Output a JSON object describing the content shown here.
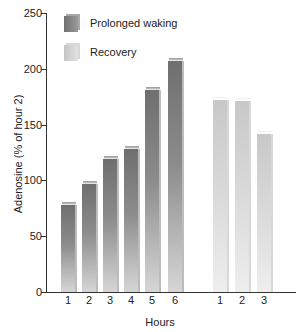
{
  "chart_data": {
    "type": "bar",
    "title": "",
    "xlabel": "Hours",
    "ylabel": "Adenosine (% of hour 2)",
    "ylim": [
      0,
      250
    ],
    "yticks": [
      0,
      50,
      100,
      150,
      200,
      250
    ],
    "grid": false,
    "legend_position": "top-left",
    "series": [
      {
        "name": "Prolonged waking",
        "categories": [
          "1",
          "2",
          "3",
          "4",
          "5",
          "6"
        ],
        "values": [
          78,
          97,
          119,
          128,
          181,
          207
        ],
        "color": "#7a7a7a"
      },
      {
        "name": "Recovery",
        "categories": [
          "1",
          "2",
          "3"
        ],
        "values": [
          172,
          171,
          142
        ],
        "color": "#d4d4d4"
      }
    ]
  },
  "labels": {
    "xtitle": "Hours",
    "ytitle": "Adenosine (% of hour 2)",
    "legend_wake": "Prolonged waking",
    "legend_rec": "Recovery",
    "yticks": [
      "0",
      "50",
      "100",
      "150",
      "200",
      "250"
    ]
  }
}
